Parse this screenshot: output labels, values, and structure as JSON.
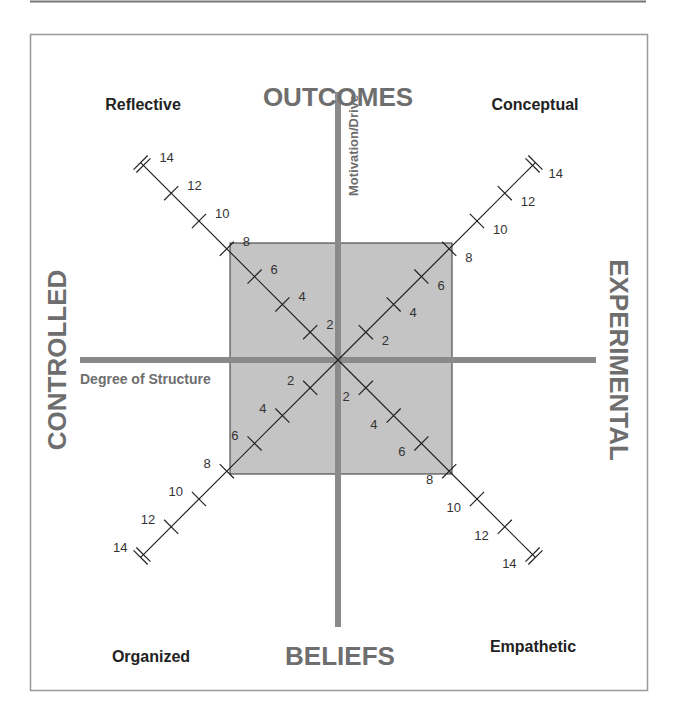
{
  "diagram": {
    "title_top": "OUTCOMES",
    "title_bottom": "BELIEFS",
    "title_left": "CONTROLLED",
    "title_right": "EXPERIMENTAL",
    "vertical_axis_label": "Motivation/Drive",
    "horizontal_axis_label": "Degree of Structure",
    "corners": {
      "top_left": "Reflective",
      "top_right": "Conceptual",
      "bottom_left": "Organized",
      "bottom_right": "Empathetic"
    },
    "diagonal_ticks": [
      "2",
      "4",
      "6",
      "8",
      "10",
      "12",
      "14"
    ],
    "shaded_region_extent": 8,
    "colors": {
      "frame": "#999999",
      "axis": "#8a8a8a",
      "shaded": "#c4c4c4",
      "title": "#6e6e6e",
      "corner_label": "#222222",
      "tick_label": "#333333"
    }
  }
}
